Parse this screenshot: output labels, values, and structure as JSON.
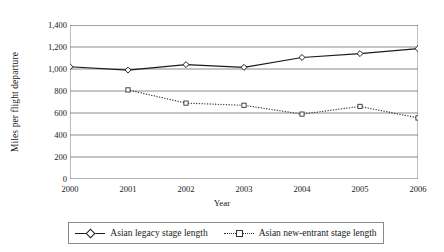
{
  "chart_data": {
    "type": "line",
    "title": "",
    "xlabel": "Year",
    "ylabel": "Miles per flight departure",
    "categories": [
      "2000",
      "2001",
      "2002",
      "2003",
      "2004",
      "2005",
      "2006"
    ],
    "x": [
      2000,
      2001,
      2002,
      2003,
      2004,
      2005,
      2006
    ],
    "ylim": [
      0,
      1400
    ],
    "yticks": [
      "0",
      "200",
      "400",
      "600",
      "800",
      "1,000",
      "1,200",
      "1,400"
    ],
    "ytick_values": [
      0,
      200,
      400,
      600,
      800,
      1000,
      1200,
      1400
    ],
    "grid": "horizontal",
    "legend_position": "bottom",
    "series": [
      {
        "name": "Asian legacy stage length",
        "marker": "diamond",
        "line_style": "solid",
        "color": "#1a1a1a",
        "values": [
          1020,
          990,
          1040,
          1015,
          1105,
          1140,
          1185
        ]
      },
      {
        "name": "Asian new-entrant stage length",
        "marker": "square",
        "line_style": "dotted",
        "color": "#333333",
        "values": [
          null,
          810,
          690,
          670,
          590,
          660,
          555
        ]
      }
    ]
  },
  "axis": {
    "y_title": "Miles per flight departure",
    "x_title": "Year"
  },
  "legend": {
    "entries": [
      {
        "label": "Asian legacy stage length"
      },
      {
        "label": "Asian new-entrant stage length"
      }
    ]
  }
}
